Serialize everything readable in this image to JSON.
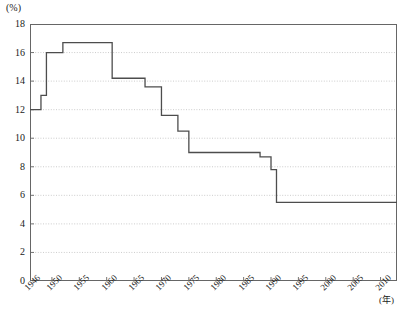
{
  "chart_data": {
    "type": "line",
    "style": "step-post",
    "title": "",
    "subtitle": "",
    "ylabel": "(%)",
    "xlabel": "(年)",
    "ylim": [
      0,
      18
    ],
    "xlim": [
      1946,
      2013
    ],
    "ytick_step": 2,
    "yticks": [
      "0",
      "2",
      "4",
      "6",
      "8",
      "10",
      "12",
      "14",
      "16",
      "18"
    ],
    "ytick_values": [
      0,
      2,
      4,
      6,
      8,
      10,
      12,
      14,
      16,
      18
    ],
    "xticks": [
      "1946",
      "1950",
      "1955",
      "1960",
      "1965",
      "1970",
      "1975",
      "1980",
      "1985",
      "1990",
      "1995",
      "2000",
      "2005",
      "2010"
    ],
    "xtick_values": [
      1946,
      1950,
      1955,
      1960,
      1965,
      1970,
      1975,
      1980,
      1985,
      1990,
      1995,
      2000,
      2005,
      2010
    ],
    "grid": "horizontal-dotted",
    "legend": "none",
    "line_color": "#4d4d4d",
    "grid_color": "#bfbfbf",
    "axis_color": "#666666",
    "background": "#ffffff",
    "x": [
      1946,
      1948,
      1949,
      1952,
      1958,
      1961,
      1967,
      1970,
      1973,
      1975,
      1988,
      1990,
      1991,
      2013
    ],
    "values": [
      12.0,
      12.0,
      13.0,
      16.0,
      16.7,
      16.7,
      14.2,
      13.6,
      11.6,
      10.5,
      9.0,
      9.0,
      8.7,
      5.5
    ],
    "steps": [
      {
        "start": 1946,
        "end": 1948,
        "value": 12.0
      },
      {
        "start": 1948,
        "end": 1949,
        "value": 13.0
      },
      {
        "start": 1949,
        "end": 1952,
        "value": 16.0
      },
      {
        "start": 1952,
        "end": 1958,
        "value": 16.7
      },
      {
        "start": 1958,
        "end": 1961,
        "value": 16.7
      },
      {
        "start": 1961,
        "end": 1967,
        "value": 14.2
      },
      {
        "start": 1967,
        "end": 1970,
        "value": 13.6
      },
      {
        "start": 1970,
        "end": 1973,
        "value": 11.6
      },
      {
        "start": 1973,
        "end": 1975,
        "value": 10.5
      },
      {
        "start": 1975,
        "end": 1988,
        "value": 9.0
      },
      {
        "start": 1988,
        "end": 1990,
        "value": 8.7
      },
      {
        "start": 1990,
        "end": 1991,
        "value": 7.8
      },
      {
        "start": 1991,
        "end": 2013,
        "value": 5.5
      }
    ]
  }
}
